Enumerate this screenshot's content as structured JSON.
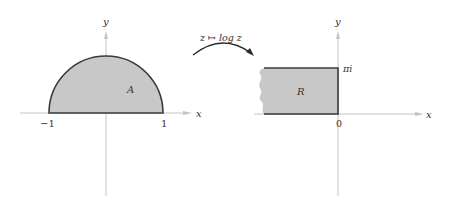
{
  "figure": {
    "left_panel": {
      "region_label": "A",
      "x_axis_label": "x",
      "y_axis_label": "y",
      "tick_labels": [
        "−1",
        "1"
      ],
      "shape": "upper half disk, radius 1"
    },
    "mapping": {
      "label": "z ↦ log z",
      "from": "left_panel",
      "to": "right_panel"
    },
    "right_panel": {
      "region_label": "R",
      "x_axis_label": "x",
      "y_axis_label": "y",
      "tick_labels": {
        "origin": "0",
        "top": "πi"
      },
      "shape": "half-infinite strip, Re < 0, 0 ≤ Im ≤ π"
    },
    "colors": {
      "fill": "#c8c8c8",
      "outline": "#3a3a3a",
      "axis": "#bdbdbd",
      "text": "#333333"
    }
  }
}
